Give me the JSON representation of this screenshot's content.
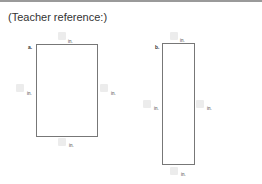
{
  "header": {
    "title": "(Teacher reference:)"
  },
  "figures": [
    {
      "label": "a.",
      "units": {
        "top": "in.",
        "left": "in.",
        "right": "in.",
        "bottom": "in."
      }
    },
    {
      "label": "b.",
      "units": {
        "top": "in.",
        "left": "in.",
        "right": "in.",
        "bottom": "in."
      }
    }
  ]
}
